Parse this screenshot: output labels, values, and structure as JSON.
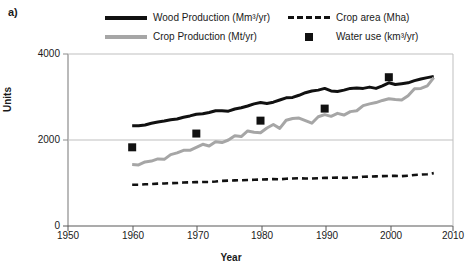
{
  "panel": {
    "label": "a)"
  },
  "legend": {
    "position": "top",
    "items": [
      {
        "name": "wood-production",
        "label": "Wood Production (Mm³/yr)",
        "marker": "solid-line",
        "color": "#111111"
      },
      {
        "name": "crop-area",
        "label": "Crop area (Mha)",
        "marker": "dashed-line",
        "color": "#111111"
      },
      {
        "name": "crop-production",
        "label": "Crop Production (Mt/yr)",
        "marker": "solid-line",
        "color": "#a6a6a6"
      },
      {
        "name": "water-use",
        "label": "Water use (km³/yr)",
        "marker": "square-point",
        "color": "#111111"
      }
    ]
  },
  "axes": {
    "xlabel": "Year",
    "ylabel": "Units",
    "xticks": [
      "1950",
      "1960",
      "1970",
      "1980",
      "1990",
      "2000",
      "2010"
    ],
    "yticks": [
      "0",
      "2000",
      "4000"
    ]
  },
  "chart_data": {
    "type": "line",
    "title": "",
    "xlabel": "Year",
    "ylabel": "Units",
    "xlim": [
      1950,
      2010
    ],
    "ylim": [
      0,
      4000
    ],
    "xticks": [
      1950,
      1960,
      1970,
      1980,
      1990,
      2000,
      2010
    ],
    "yticks": [
      0,
      2000,
      4000
    ],
    "grid": "horizontal-gridline-at-2000",
    "legend_position": "above-plot",
    "series": [
      {
        "name": "Wood Production (Mm3/yr)",
        "style": "solid",
        "color": "#111111",
        "x": [
          1960,
          1961,
          1962,
          1963,
          1964,
          1965,
          1966,
          1967,
          1968,
          1969,
          1970,
          1971,
          1972,
          1973,
          1974,
          1975,
          1976,
          1977,
          1978,
          1979,
          1980,
          1981,
          1982,
          1983,
          1984,
          1985,
          1986,
          1987,
          1988,
          1989,
          1990,
          1991,
          1992,
          1993,
          1994,
          1995,
          1996,
          1997,
          1998,
          1999,
          2000,
          2001,
          2002,
          2003,
          2004,
          2005,
          2006,
          2007
        ],
        "y": [
          2330,
          2330,
          2350,
          2390,
          2420,
          2440,
          2470,
          2490,
          2530,
          2560,
          2600,
          2610,
          2640,
          2680,
          2680,
          2670,
          2720,
          2750,
          2790,
          2840,
          2870,
          2850,
          2880,
          2930,
          2980,
          2990,
          3040,
          3100,
          3140,
          3160,
          3200,
          3140,
          3130,
          3160,
          3200,
          3210,
          3200,
          3230,
          3200,
          3260,
          3330,
          3290,
          3310,
          3330,
          3380,
          3420,
          3450,
          3480
        ]
      },
      {
        "name": "Crop Production (Mt/yr)",
        "style": "solid",
        "color": "#a6a6a6",
        "x": [
          1960,
          1961,
          1962,
          1963,
          1964,
          1965,
          1966,
          1967,
          1968,
          1969,
          1970,
          1971,
          1972,
          1973,
          1974,
          1975,
          1976,
          1977,
          1978,
          1979,
          1980,
          1981,
          1982,
          1983,
          1984,
          1985,
          1986,
          1987,
          1988,
          1989,
          1990,
          1991,
          1992,
          1993,
          1994,
          1995,
          1996,
          1997,
          1998,
          1999,
          2000,
          2001,
          2002,
          2003,
          2004,
          2005,
          2006,
          2007
        ],
        "y": [
          1430,
          1420,
          1490,
          1510,
          1560,
          1550,
          1660,
          1700,
          1760,
          1760,
          1830,
          1900,
          1860,
          1960,
          1940,
          2000,
          2100,
          2080,
          2210,
          2180,
          2170,
          2280,
          2360,
          2270,
          2460,
          2500,
          2510,
          2450,
          2390,
          2540,
          2590,
          2550,
          2620,
          2580,
          2660,
          2680,
          2800,
          2840,
          2870,
          2920,
          2960,
          2940,
          2930,
          3030,
          3190,
          3200,
          3260,
          3450
        ]
      },
      {
        "name": "Crop area (Mha)",
        "style": "dashed",
        "color": "#111111",
        "x": [
          1960,
          1961,
          1962,
          1963,
          1964,
          1965,
          1966,
          1967,
          1968,
          1969,
          1970,
          1971,
          1972,
          1973,
          1974,
          1975,
          1976,
          1977,
          1978,
          1979,
          1980,
          1981,
          1982,
          1983,
          1984,
          1985,
          1986,
          1987,
          1988,
          1989,
          1990,
          1991,
          1992,
          1993,
          1994,
          1995,
          1996,
          1997,
          1998,
          1999,
          2000,
          2001,
          2002,
          2003,
          2004,
          2005,
          2006,
          2007
        ],
        "y": [
          960,
          960,
          970,
          975,
          985,
          990,
          995,
          1000,
          1010,
          1015,
          1020,
          1025,
          1025,
          1035,
          1050,
          1055,
          1060,
          1065,
          1070,
          1075,
          1080,
          1085,
          1090,
          1085,
          1100,
          1105,
          1110,
          1105,
          1105,
          1110,
          1120,
          1120,
          1125,
          1120,
          1125,
          1130,
          1145,
          1150,
          1155,
          1160,
          1165,
          1165,
          1160,
          1170,
          1185,
          1195,
          1205,
          1230
        ]
      },
      {
        "name": "Water use (km3/yr)",
        "style": "points",
        "color": "#111111",
        "x": [
          1960,
          1970,
          1980,
          1990,
          2000
        ],
        "y": [
          1830,
          2150,
          2450,
          2730,
          3460
        ]
      }
    ]
  }
}
